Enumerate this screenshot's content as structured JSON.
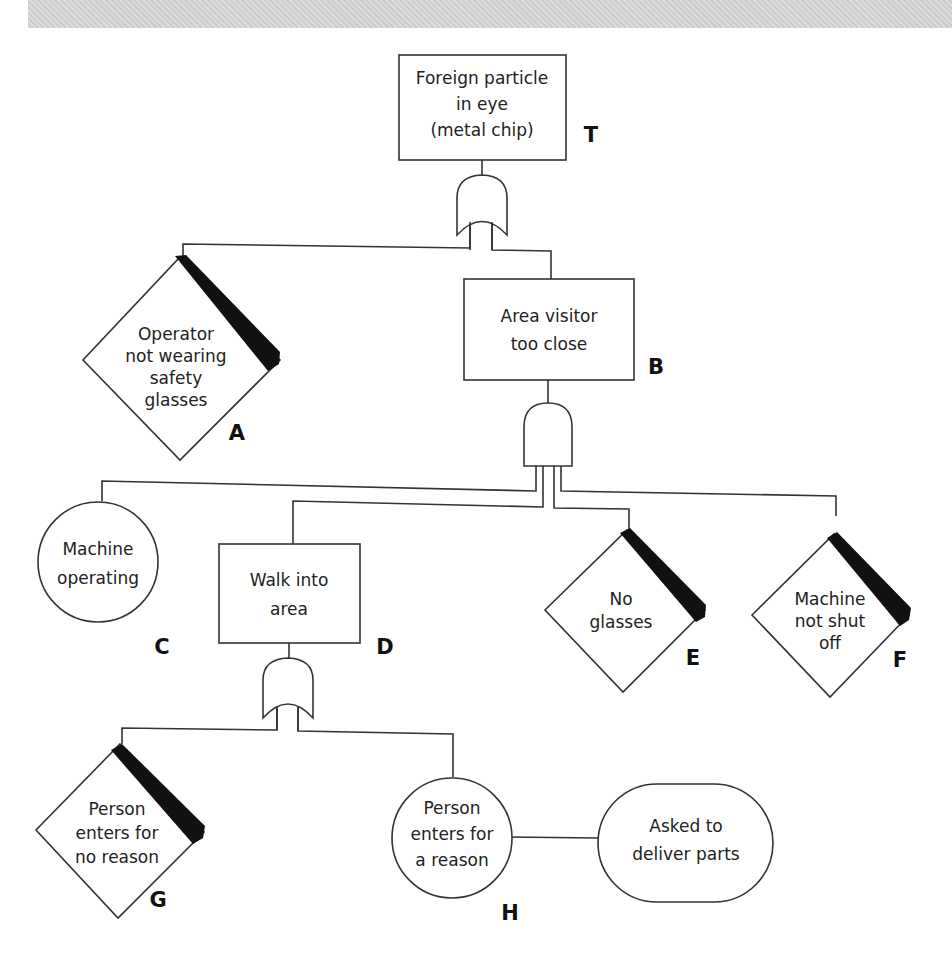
{
  "diagram": {
    "type": "fault-tree",
    "nodes": {
      "T": {
        "id": "T",
        "kind": "top-event-rectangle",
        "lines": [
          "Foreign particle",
          "in eye",
          "(metal chip)"
        ],
        "gate": "OR"
      },
      "A": {
        "id": "A",
        "kind": "undeveloped-event-diamond",
        "lines": [
          "Operator",
          "not wearing",
          "safety",
          "glasses"
        ]
      },
      "B": {
        "id": "B",
        "kind": "intermediate-event-rectangle",
        "lines": [
          "Area visitor",
          "too close"
        ],
        "gate": "AND"
      },
      "C": {
        "id": "C",
        "kind": "basic-event-circle",
        "lines": [
          "Machine",
          "operating"
        ]
      },
      "D": {
        "id": "D",
        "kind": "intermediate-event-rectangle",
        "lines": [
          "Walk into",
          "area"
        ],
        "gate": "OR"
      },
      "E": {
        "id": "E",
        "kind": "undeveloped-event-diamond",
        "lines": [
          "No",
          "glasses"
        ]
      },
      "F": {
        "id": "F",
        "kind": "undeveloped-event-diamond",
        "lines": [
          "Machine",
          "not shut",
          "off"
        ]
      },
      "G": {
        "id": "G",
        "kind": "undeveloped-event-diamond",
        "lines": [
          "Person",
          "enters for",
          "no reason"
        ]
      },
      "H": {
        "id": "H",
        "kind": "basic-event-circle",
        "lines": [
          "Person",
          "enters for",
          "a reason"
        ]
      },
      "H_condition": {
        "kind": "conditioning-event-oval",
        "lines": [
          "Asked to",
          "deliver parts"
        ]
      }
    },
    "edges": [
      [
        "T",
        "A"
      ],
      [
        "T",
        "B"
      ],
      [
        "B",
        "C"
      ],
      [
        "B",
        "D"
      ],
      [
        "B",
        "E"
      ],
      [
        "B",
        "F"
      ],
      [
        "D",
        "G"
      ],
      [
        "D",
        "H"
      ],
      [
        "H",
        "H_condition"
      ]
    ]
  }
}
